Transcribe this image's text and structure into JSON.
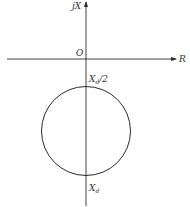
{
  "diagram": {
    "type": "impedance-plane circle",
    "axes": {
      "horizontal_label": "R",
      "vertical_label": "jX",
      "origin_label": "O"
    },
    "circle": {
      "top_label": "X_d/2",
      "top_label_main": "X",
      "top_label_sub": "d",
      "top_label_tail": "/2",
      "bottom_label": "X_d",
      "bottom_label_main": "X",
      "bottom_label_sub": "d"
    },
    "colors": {
      "line": "#2a2a2a",
      "text": "#333333",
      "background": "#ffffff"
    }
  }
}
